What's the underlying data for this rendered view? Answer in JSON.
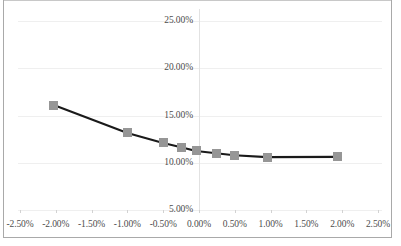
{
  "chart_data": {
    "type": "line",
    "title": "",
    "xlabel": "",
    "ylabel": "",
    "xlim": [
      -2.5,
      2.5
    ],
    "ylim": [
      5.0,
      25.0
    ],
    "grid": true,
    "legend": "none",
    "x_tick_labels": [
      "-2.50%",
      "-2.00%",
      "-1.50%",
      "-1.00%",
      "-0.50%",
      "0.00%",
      "0.50%",
      "1.00%",
      "1.50%",
      "2.00%",
      "2.50%"
    ],
    "x_tick_values": [
      -2.5,
      -2.0,
      -1.5,
      -1.0,
      -0.5,
      0.0,
      0.5,
      1.0,
      1.5,
      2.0,
      2.5
    ],
    "y_tick_labels": [
      "25.00%",
      "20.00%",
      "15.00%",
      "10.00%",
      "5.00%"
    ],
    "y_tick_values": [
      25.0,
      20.0,
      15.0,
      10.0,
      5.0
    ],
    "series": [
      {
        "name": "series-1",
        "line_color": "#1a1a1a",
        "marker_color": "#969696",
        "marker_shape": "square",
        "x": [
          -2.03,
          -1.0,
          -0.5,
          -0.25,
          -0.04,
          0.24,
          0.49,
          0.95,
          1.93
        ],
        "y": [
          16.1,
          13.15,
          12.1,
          11.65,
          11.25,
          11.0,
          10.8,
          10.6,
          10.62
        ],
        "point_labels": [
          "-2.03%, 16.10%",
          "-1.00%, 13.15%",
          "-0.50%, 12.10%",
          "-0.25%, 11.65%",
          "-0.04%, 11.25%",
          "0.24%, 11.00%",
          "0.49%, 10.80%",
          "0.95%, 10.60%",
          "1.93%, 10.62%"
        ]
      }
    ]
  },
  "colors": {
    "line": "#1a1a1a",
    "marker": "#969696",
    "gridline": "#efefef",
    "axis": "#e2e2e2",
    "tick_text": "#4d4d4d",
    "frame": "#a9a9a9",
    "background": "#ffffff"
  }
}
